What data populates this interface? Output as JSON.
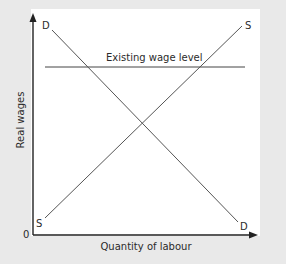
{
  "diagram": {
    "annotation": "Existing wage level",
    "y_axis_label": "Real wages",
    "x_axis_label": "Quantity of labour",
    "origin_label": "0",
    "demand_curve": {
      "start_label": "D",
      "end_label": "D"
    },
    "supply_curve": {
      "start_label": "S",
      "end_label": "S"
    }
  },
  "colors": {
    "frame": "#e9e9e9",
    "plot": "#ffffff",
    "line": "#444444",
    "axis": "#222222"
  }
}
